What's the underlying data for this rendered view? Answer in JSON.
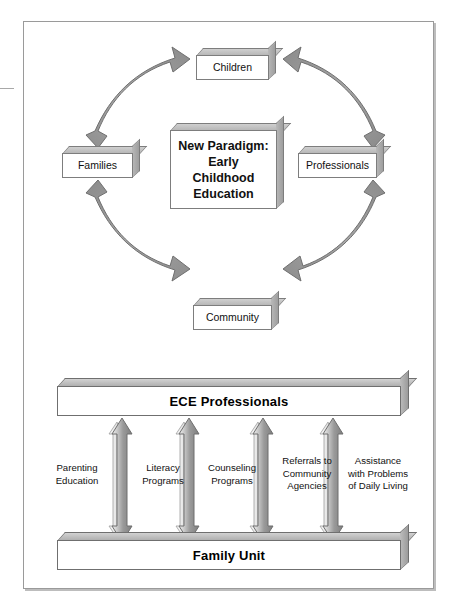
{
  "diagram": {
    "title": "New Paradigm: Early Childhood Education",
    "cycle": {
      "center_lines": [
        "New Paradigm:",
        "Early",
        "Childhood",
        "Education"
      ],
      "nodes": [
        {
          "id": "children",
          "label": "Children"
        },
        {
          "id": "professionals",
          "label": "Professionals"
        },
        {
          "id": "community",
          "label": "Community"
        },
        {
          "id": "families",
          "label": "Families"
        }
      ],
      "connectors": [
        {
          "from": "families",
          "to": "children",
          "style": "curved-double-arrow"
        },
        {
          "from": "children",
          "to": "professionals",
          "style": "curved-double-arrow"
        },
        {
          "from": "professionals",
          "to": "community",
          "style": "curved-double-arrow"
        },
        {
          "from": "community",
          "to": "families",
          "style": "curved-double-arrow"
        }
      ]
    },
    "relationship": {
      "top_bar_label": "ECE Professionals",
      "bottom_bar_label": "Family Unit",
      "services": [
        {
          "label": "Parenting\nEducation"
        },
        {
          "label": "Literacy\nPrograms"
        },
        {
          "label": "Counseling\nPrograms"
        },
        {
          "label": "Referrals to\nCommunity\nAgencies"
        },
        {
          "label": "Assistance\nwith Problems\nof Daily Living"
        }
      ],
      "arrow_count": 4,
      "arrow_style": "vertical-double-arrow"
    },
    "colors": {
      "arrow_fill_dark": "#8a8a8a",
      "arrow_fill_light": "#d8d8d8",
      "outline": "#6f6f6f",
      "box_face": "#ffffff",
      "frame_border": "#9a9a9a"
    }
  }
}
